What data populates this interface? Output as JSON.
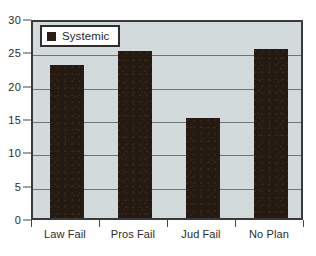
{
  "chart_data": {
    "type": "bar",
    "title": "",
    "xlabel": "",
    "ylabel": "",
    "categories": [
      "Law Fail",
      "Pros Fail",
      "Jud Fail",
      "No Plan"
    ],
    "values": [
      23,
      25,
      15,
      25.3
    ],
    "series": [
      {
        "name": "Systemic",
        "values": [
          23,
          25,
          15,
          25.3
        ]
      }
    ],
    "ylim": [
      0,
      30
    ],
    "y_ticks": [
      0,
      5,
      10,
      15,
      20,
      25,
      30
    ],
    "y_tick_labels": [
      "0",
      "5",
      "10",
      "15",
      "20",
      "25",
      "30"
    ],
    "grid": true,
    "grid_axis": "y",
    "legend": {
      "position": "upper-left-inside",
      "entries": [
        {
          "label": "Systemic",
          "swatch": "legend-swatch-icon",
          "color": "#2b1d14"
        }
      ]
    },
    "colors": {
      "bar": "#241a12",
      "plot_background": "#d2dadb",
      "plot_border": "#3a3a3a",
      "gridline": "#6e7577",
      "text": "#2b2b2b",
      "figure_background": "#ffffff",
      "legend_background": "#ffffff",
      "legend_border": "#2e2e2e"
    }
  }
}
